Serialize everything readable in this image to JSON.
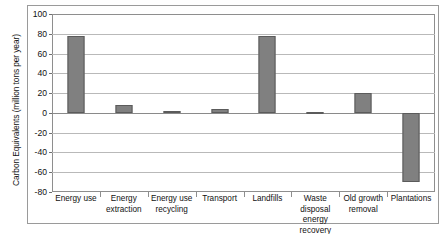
{
  "chart_data": {
    "type": "bar",
    "title": "",
    "subtitle": "",
    "xlabel": "",
    "ylabel": "Carbon Equivalents (million tons per year)",
    "categories": [
      "Energy use",
      "Energy extraction",
      "Energy use recycling",
      "Transport",
      "Landfills",
      "Waste disposal energy recovery",
      "Old growth removal",
      "Plantations"
    ],
    "values": [
      78,
      8,
      1.5,
      4,
      78,
      1,
      20,
      -70
    ],
    "ylim": [
      -80,
      100
    ],
    "ytick_step": 20,
    "yticks": [
      100,
      80,
      60,
      40,
      20,
      0,
      -20,
      -40,
      -60,
      -80
    ],
    "ytick_labels": [
      "100",
      "80",
      "60",
      "40",
      "20",
      "0",
      "-20",
      "-40",
      "-60",
      "-80"
    ],
    "grid": true,
    "grid_axis": "y",
    "legend": false,
    "legend_position": "none",
    "bar_color": "#808080",
    "bar_edge_color": "#5b5b5b",
    "gridline_color": "#b9b9b9",
    "frame_color": "#8e8e8e",
    "background_color": "#ffffff"
  }
}
